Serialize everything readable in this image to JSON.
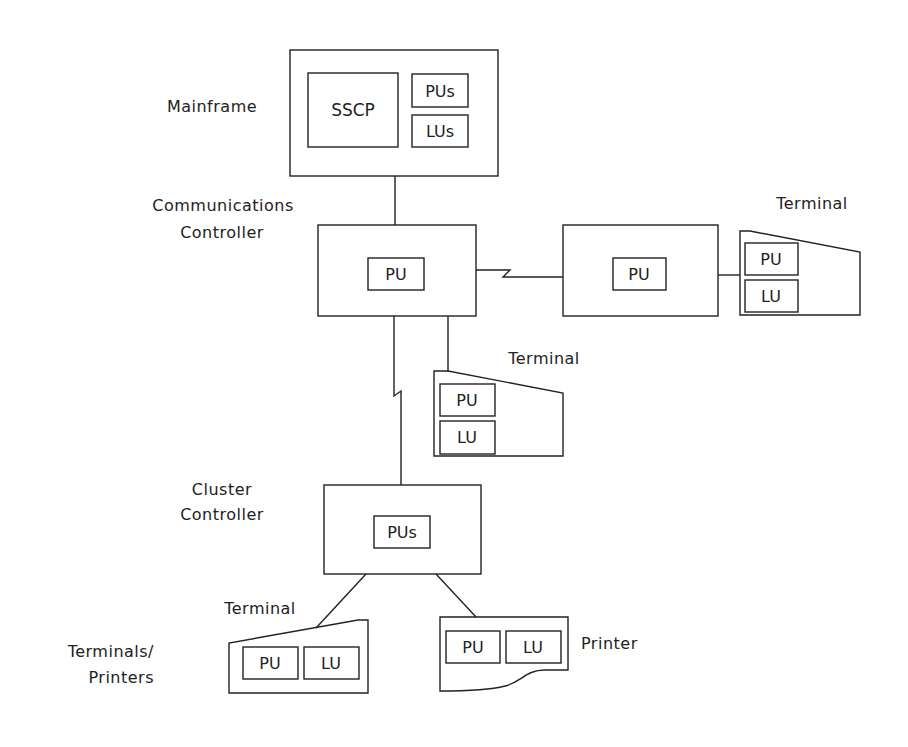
{
  "diagram": {
    "labels": {
      "mainframe": "Mainframe",
      "comm_line1": "Communications",
      "comm_line2": "Controller",
      "terminal_right": "Terminal",
      "terminal_middle": "Terminal",
      "cluster_line1": "Cluster",
      "cluster_line2": "Controller",
      "terminal_bottom": "Terminal",
      "terminals_line1": "Terminals/",
      "terminals_line2": "Printers",
      "printer": "Printer"
    },
    "nodes": {
      "mainframe": {
        "sscp": "SSCP",
        "pus": "PUs",
        "lus": "LUs"
      },
      "comm_controller": {
        "pu": "PU"
      },
      "remote_controller": {
        "pu": "PU"
      },
      "terminal_right": {
        "pu": "PU",
        "lu": "LU"
      },
      "terminal_middle": {
        "pu": "PU",
        "lu": "LU"
      },
      "cluster_controller": {
        "pus": "PUs"
      },
      "terminal_bottom": {
        "pu": "PU",
        "lu": "LU"
      },
      "printer": {
        "pu": "PU",
        "lu": "LU"
      }
    },
    "colors": {
      "line": "#222222",
      "background": "#ffffff"
    }
  }
}
